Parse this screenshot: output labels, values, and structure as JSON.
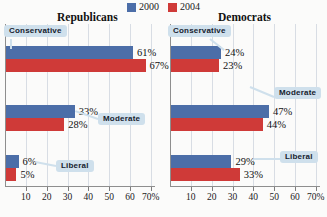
{
  "legend": {
    "items": [
      {
        "label": "2000",
        "color": "#4c6ea8",
        "swatch_name": "legend-swatch-2000"
      },
      {
        "label": "2004",
        "color": "#cf3a38",
        "swatch_name": "legend-swatch-2004"
      }
    ]
  },
  "chart_data": {
    "type": "bar",
    "orientation": "horizontal",
    "title": "",
    "xlabel": "",
    "ylabel": "",
    "xlim": [
      0,
      72
    ],
    "xticks": [
      10,
      20,
      30,
      40,
      50,
      60,
      70
    ],
    "xticklabels": [
      "10",
      "20",
      "30",
      "40",
      "50",
      "60",
      "70%"
    ],
    "grid": "vertical",
    "legend_position": "top-center",
    "panels": [
      {
        "title": "Republicans",
        "categories": [
          "Conservative",
          "Moderate",
          "Liberal"
        ],
        "series": [
          {
            "name": "2000",
            "color": "#4c6ea8",
            "values": [
              61,
              33,
              6
            ]
          },
          {
            "name": "2004",
            "color": "#cf3a38",
            "values": [
              67,
              28,
              5
            ]
          }
        ],
        "value_labels": [
          [
            "61%",
            "33%",
            "6%"
          ],
          [
            "67%",
            "28%",
            "5%"
          ]
        ]
      },
      {
        "title": "Democrats",
        "categories": [
          "Conservative",
          "Moderate",
          "Liberal"
        ],
        "series": [
          {
            "name": "2000",
            "color": "#4c6ea8",
            "values": [
              24,
              47,
              29
            ]
          },
          {
            "name": "2004",
            "color": "#cf3a38",
            "values": [
              23,
              44,
              33
            ]
          }
        ],
        "value_labels": [
          [
            "24%",
            "47%",
            "29%"
          ],
          [
            "23%",
            "44%",
            "33%"
          ]
        ]
      }
    ]
  }
}
